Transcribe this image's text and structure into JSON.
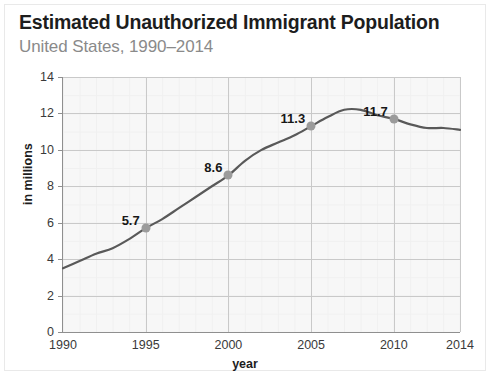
{
  "header": {
    "title": "Estimated Unauthorized Immigrant Population",
    "subtitle": "United States, 1990–2014"
  },
  "chart_data": {
    "type": "line",
    "title": "Estimated Unauthorized Immigrant Population",
    "subtitle": "United States, 1990–2014",
    "xlabel": "year",
    "ylabel": "in millions",
    "xlim": [
      1990,
      2014
    ],
    "ylim": [
      0,
      14
    ],
    "grid": true,
    "legend": "none",
    "y_ticks": [
      0,
      2,
      4,
      6,
      8,
      10,
      12,
      14
    ],
    "y_tick_labels": [
      "0",
      "2",
      "4",
      "6",
      "8",
      "10",
      "12",
      "14"
    ],
    "x_ticks": [
      1990,
      1995,
      2000,
      2005,
      2010,
      2014
    ],
    "x_tick_labels": [
      "1990",
      "1995",
      "2000",
      "2005",
      "2010",
      "2014"
    ],
    "line_color": "#595959",
    "marker_color": "#9b9b9b",
    "series": [
      {
        "name": "Unauthorized immigrant population",
        "x": [
          1990,
          1991,
          1992,
          1993,
          1994,
          1995,
          1996,
          1997,
          1998,
          1999,
          2000,
          2001,
          2002,
          2003,
          2004,
          2005,
          2006,
          2007,
          2008,
          2009,
          2010,
          2011,
          2012,
          2013,
          2014
        ],
        "values": [
          3.5,
          3.9,
          4.3,
          4.6,
          5.1,
          5.7,
          6.2,
          6.8,
          7.4,
          8.0,
          8.6,
          9.4,
          10.0,
          10.4,
          10.8,
          11.3,
          11.8,
          12.2,
          12.2,
          11.9,
          11.7,
          11.4,
          11.2,
          11.2,
          11.1
        ]
      }
    ],
    "annotated_points": [
      {
        "x": 1995,
        "y": 5.7,
        "label": "5.7"
      },
      {
        "x": 2000,
        "y": 8.6,
        "label": "8.6"
      },
      {
        "x": 2005,
        "y": 11.3,
        "label": "11.3"
      },
      {
        "x": 2010,
        "y": 11.7,
        "label": "11.7"
      }
    ]
  }
}
